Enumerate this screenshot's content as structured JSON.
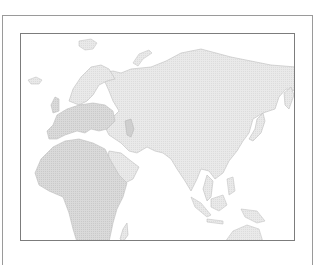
{
  "map": {
    "region": "Eurasia and Africa",
    "colors": {
      "land": "#e6e6e6",
      "land_highlight": "#d6d6d6",
      "coast": "#bdbdbd",
      "water": "#ffffff",
      "frame": "#7c7c7c"
    },
    "landmasses": [
      "Greenland (partial)",
      "Iceland",
      "Svalbard",
      "Scandinavia",
      "Europe",
      "Africa",
      "Arabia",
      "Asia",
      "Japan",
      "Southeast Asia",
      "Indonesia",
      "Australia (partial)",
      "Madagascar"
    ]
  }
}
